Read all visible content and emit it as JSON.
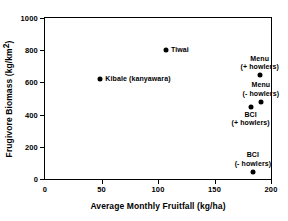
{
  "chart_data": {
    "type": "scatter",
    "title": "",
    "xlabel": "Average Monthly Fruitfall (kg/ha)",
    "ylabel": "Frugivore Biomass (kg/km²)",
    "ylabel_base": "Frugivore Biomass (kg/km",
    "ylabel_sup": "2",
    "ylabel_tail": ")",
    "xlim": [
      0,
      200
    ],
    "ylim": [
      0,
      1000
    ],
    "xticks": [
      0,
      50,
      100,
      150,
      200
    ],
    "xticklabels": [
      "0",
      "50",
      "100",
      "150",
      "200"
    ],
    "yticks": [
      0,
      200,
      400,
      600,
      800,
      1000
    ],
    "yticklabels": [
      "0",
      "200",
      "400",
      "600",
      "800",
      "1000"
    ],
    "grid": false,
    "legend": "none",
    "marker": "filled-circle",
    "marker_color": "#000000",
    "points": [
      {
        "label": "Tiwai",
        "x": 107,
        "y": 800,
        "label_pos": "right"
      },
      {
        "label": "Kibale (kanyawara)",
        "x": 49,
        "y": 620,
        "label_pos": "right"
      },
      {
        "label": "Menu\n(+ howlers)",
        "x": 190,
        "y": 645,
        "label_pos": "above"
      },
      {
        "label": "Menu\n(- howlers)",
        "x": 191,
        "y": 480,
        "label_pos": "above"
      },
      {
        "label": "BCI\n(+ howlers)",
        "x": 182,
        "y": 450,
        "label_pos": "below"
      },
      {
        "label": "BCI\n(- howlers)",
        "x": 184,
        "y": 45,
        "label_pos": "above"
      }
    ]
  }
}
